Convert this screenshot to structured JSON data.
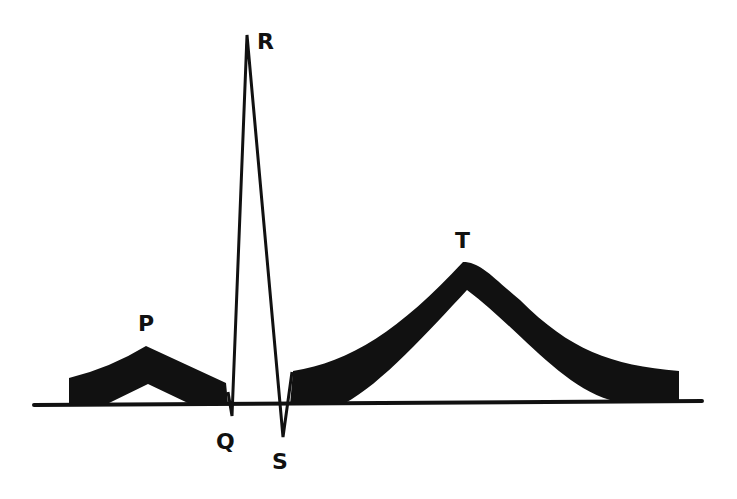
{
  "diagram": {
    "type": "ecg-waveform",
    "colors": {
      "ink": "#111111",
      "background": "#ffffff"
    },
    "labels": {
      "p": "P",
      "q": "Q",
      "r": "R",
      "s": "S",
      "t": "T"
    }
  }
}
